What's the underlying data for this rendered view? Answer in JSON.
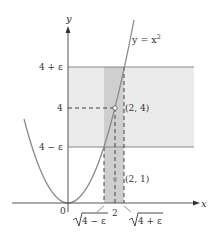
{
  "figure": {
    "type": "epsilon-delta limit diagram",
    "curve_label": "y = x",
    "curve_exponent": "2",
    "axis_labels": {
      "x": "x",
      "y": "y"
    },
    "origin_label": "0",
    "y_ticks": [
      {
        "label": "4 + ε",
        "value": "4+eps"
      },
      {
        "label": "4",
        "value": "4"
      },
      {
        "label": "4 − ε",
        "value": "4-eps"
      }
    ],
    "x_ticks": [
      {
        "label": "4 − ε",
        "value": "sqrt(4-eps)",
        "radical": true
      },
      {
        "label": "2",
        "value": "2"
      },
      {
        "label": "4 + ε",
        "value": "sqrt(4+eps)",
        "radical": true
      }
    ],
    "points": [
      {
        "label": "(2, 4)",
        "x": 2,
        "y": 4,
        "style": "open"
      },
      {
        "label": "(2, 1)",
        "x": 2,
        "y": 1,
        "style": "filled"
      }
    ],
    "colors": {
      "horizontal_band": "#ebebeb",
      "vertical_band": "#cfcfcf",
      "curve": "#8a8a8a",
      "axis": "#555555",
      "band_edge": "#888888"
    }
  }
}
